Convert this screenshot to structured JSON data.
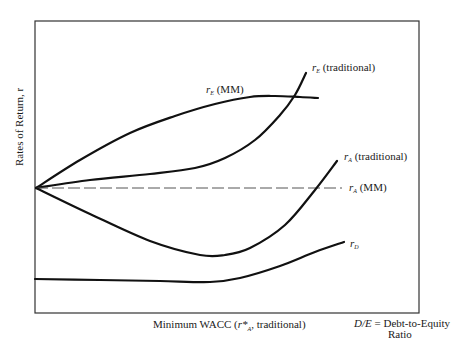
{
  "chart_data": {
    "type": "line",
    "title": "",
    "xlabel": "D/E = Debt-to-Equity Ratio",
    "ylabel": "Rates of Return, r",
    "x_annotation": "Minimum WACC (r*A, traditional)",
    "grid": false,
    "axis_ticks": "none",
    "frame": {
      "left": 35,
      "top": 21,
      "right": 419,
      "bottom": 313
    },
    "origin_point": {
      "x": 36,
      "y": 188
    },
    "series": [
      {
        "name": "r_E (MM)",
        "style": "solid",
        "points": [
          [
            36,
            188
          ],
          [
            80,
            160
          ],
          [
            130,
            133
          ],
          [
            175,
            116
          ],
          [
            215,
            104
          ],
          [
            250,
            97
          ],
          [
            275,
            96
          ],
          [
            300,
            97
          ],
          [
            318,
            98
          ]
        ]
      },
      {
        "name": "r_E (traditional)",
        "style": "solid",
        "points": [
          [
            36,
            188
          ],
          [
            90,
            180
          ],
          [
            150,
            174
          ],
          [
            195,
            168
          ],
          [
            225,
            158
          ],
          [
            255,
            140
          ],
          [
            280,
            115
          ],
          [
            295,
            95
          ],
          [
            306,
            73
          ]
        ]
      },
      {
        "name": "r_A (MM)",
        "style": "dashed",
        "points": [
          [
            36,
            188
          ],
          [
            342,
            188
          ]
        ]
      },
      {
        "name": "r_A (traditional)",
        "style": "solid",
        "points": [
          [
            36,
            188
          ],
          [
            90,
            214
          ],
          [
            150,
            241
          ],
          [
            200,
            255
          ],
          [
            225,
            255
          ],
          [
            250,
            248
          ],
          [
            285,
            225
          ],
          [
            315,
            190
          ],
          [
            337,
            161
          ]
        ]
      },
      {
        "name": "r_D",
        "style": "solid",
        "points": [
          [
            35,
            279
          ],
          [
            100,
            280
          ],
          [
            160,
            281
          ],
          [
            210,
            282
          ],
          [
            240,
            278
          ],
          [
            280,
            266
          ],
          [
            315,
            252
          ],
          [
            344,
            242
          ]
        ]
      }
    ],
    "labels": [
      {
        "text_main": "r",
        "sub": "E",
        "suffix": " (traditional)",
        "x": 312,
        "y": 62
      },
      {
        "text_main": "r",
        "sub": "E",
        "suffix": " (MM)",
        "x": 206,
        "y": 84
      },
      {
        "text_main": "r",
        "sub": "A",
        "suffix": " (traditional)",
        "x": 344,
        "y": 151
      },
      {
        "text_main": "r",
        "sub": "A",
        "suffix": " (MM)",
        "x": 349,
        "y": 182
      },
      {
        "text_main": "r",
        "sub": "D",
        "suffix": "",
        "x": 350,
        "y": 238
      }
    ]
  },
  "labels": {
    "ylabel": "Rates of Return, r",
    "x_annotation_prefix": "Minimum WACC (",
    "x_annotation_var": "r*",
    "x_annotation_sub": "A",
    "x_annotation_suffix": ", traditional)",
    "de_var": "D/E",
    "de_eq": " = Debt-to-Equity",
    "de_line2": "Ratio"
  }
}
